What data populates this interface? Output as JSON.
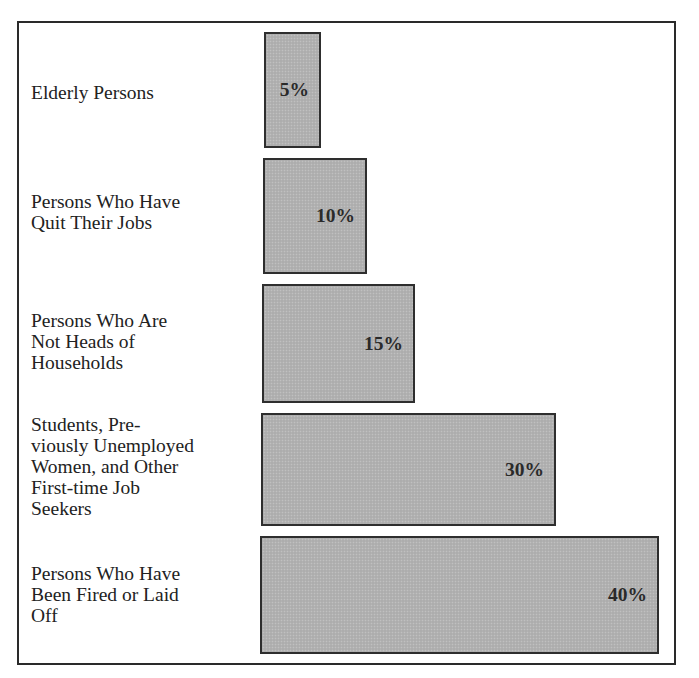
{
  "chart_data": {
    "type": "bar",
    "orientation": "horizontal",
    "title": "",
    "xlabel": "",
    "ylabel": "",
    "grid": false,
    "legend": null,
    "value_format": "percent",
    "categories": [
      "Elderly Persons",
      "Persons Who Have Quit Their Jobs",
      "Persons Who Are Not Heads of Households",
      "Students, Previously Unemployed Women, and Other First-time Job Seekers",
      "Persons Who Have Been Fired or Laid Off"
    ],
    "values": [
      5,
      10,
      15,
      30,
      40
    ],
    "data_labels": [
      "5%",
      "10%",
      "15%",
      "30%",
      "40%"
    ],
    "xlim": [
      0,
      40
    ]
  },
  "rows": [
    {
      "label": "Elderly Persons",
      "value_label": "5%",
      "value": 5,
      "bar": {
        "left": 264,
        "top": 32,
        "width": 57,
        "height": 116
      },
      "label_center_y": 92
    },
    {
      "label": "Persons Who Have\nQuit Their Jobs",
      "value_label": "10%",
      "value": 10,
      "bar": {
        "left": 263,
        "top": 158,
        "width": 104,
        "height": 116
      },
      "label_center_y": 212
    },
    {
      "label": "Persons Who Are\nNot Heads of\nHouseholds",
      "value_label": "15%",
      "value": 15,
      "bar": {
        "left": 262,
        "top": 284,
        "width": 153,
        "height": 119
      },
      "label_center_y": 341
    },
    {
      "label": "Students, Pre-\nviously Unemployed\nWomen, and Other\nFirst-time Job\nSeekers",
      "value_label": "30%",
      "value": 30,
      "bar": {
        "left": 261,
        "top": 413,
        "width": 295,
        "height": 113
      },
      "label_center_y": 466
    },
    {
      "label": "Persons Who Have\nBeen Fired or Laid\nOff",
      "value_label": "40%",
      "value": 40,
      "bar": {
        "left": 260,
        "top": 536,
        "width": 399,
        "height": 118
      },
      "label_center_y": 594
    }
  ],
  "colors": {
    "bar_fill": "#b2b2b2",
    "bar_border": "#2e2e2e",
    "frame": "#2a2a2a",
    "text": "#222222",
    "background": "#ffffff"
  }
}
